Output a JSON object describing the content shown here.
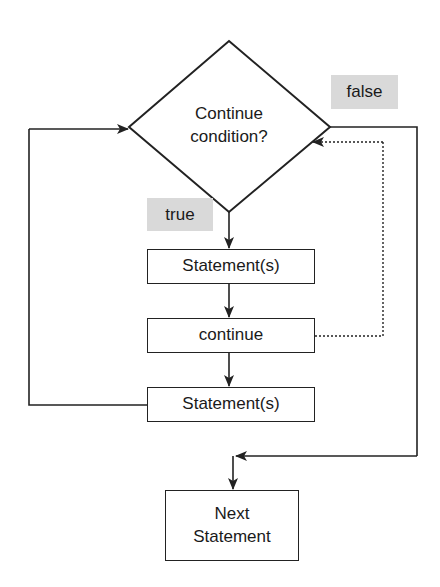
{
  "diagram": {
    "type": "flowchart",
    "decision": {
      "text_line1": "Continue",
      "text_line2": "condition?"
    },
    "labels": {
      "false": "false",
      "true": "true"
    },
    "boxes": {
      "statement1": "Statement(s)",
      "continue": "continue",
      "statement2": "Statement(s)",
      "next_line1": "Next",
      "next_line2": "Statement"
    },
    "colors": {
      "line": "#222222",
      "label_bg": "#d9d9d9"
    }
  }
}
